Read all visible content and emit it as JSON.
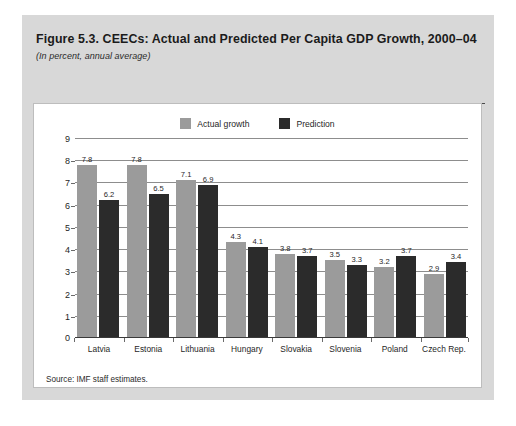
{
  "figure": {
    "title": "Figure 5.3. CEECs: Actual and Predicted Per Capita GDP Growth, 2000–04",
    "subtitle": "(In percent, annual average)",
    "source": "Source: IMF staff estimates."
  },
  "colors": {
    "actual": "#9b9b9b",
    "prediction": "#2b2b2b",
    "gridline": "#8d8d8d",
    "axis": "#3a3a3a",
    "page_background": "#d8d8d8",
    "card_background": "#ffffff",
    "text": "#1f1f1f"
  },
  "chart_data": {
    "type": "bar",
    "title": "Figure 5.3. CEECs: Actual and Predicted Per Capita GDP Growth, 2000–04",
    "subtitle": "(In percent, annual average)",
    "xlabel": "",
    "ylabel": "",
    "ylim": [
      0,
      9
    ],
    "yticks": [
      0,
      1,
      2,
      3,
      4,
      5,
      6,
      7,
      8,
      9
    ],
    "ytick_labels": [
      "0",
      "1",
      "2",
      "3",
      "4",
      "5",
      "6",
      "7",
      "8",
      "9"
    ],
    "grid": true,
    "legend_position": "top-center",
    "categories": [
      "Latvia",
      "Estonia",
      "Lithuania",
      "Hungary",
      "Slovakia",
      "Slovenia",
      "Poland",
      "Czech Rep."
    ],
    "series": [
      {
        "name": "Actual growth",
        "color": "#9b9b9b",
        "values": [
          7.8,
          7.8,
          7.1,
          4.3,
          3.8,
          3.5,
          3.2,
          2.9
        ],
        "labels": [
          "7.8",
          "7.8",
          "7.1",
          "4.3",
          "3.8",
          "3.5",
          "3.2",
          "2.9"
        ]
      },
      {
        "name": "Prediction",
        "color": "#2b2b2b",
        "values": [
          6.2,
          6.5,
          6.9,
          4.1,
          3.7,
          3.3,
          3.7,
          3.4
        ],
        "labels": [
          "6.2",
          "6.5",
          "6.9",
          "4.1",
          "3.7",
          "3.3",
          "3.7",
          "3.4"
        ]
      }
    ]
  }
}
